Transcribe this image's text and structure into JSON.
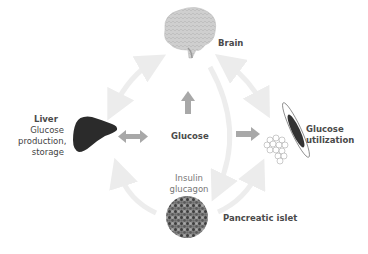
{
  "diagram": {
    "nodes": {
      "brain": {
        "label": "Brain"
      },
      "liver": {
        "label": "Liver",
        "sublabel": [
          "Glucose",
          "production,",
          "storage"
        ]
      },
      "glucose": {
        "label": "Glucose"
      },
      "muscle_fat": {
        "label": [
          "Glucose",
          "utilization"
        ]
      },
      "hormones": {
        "label": [
          "Insulin",
          "glucagon"
        ]
      },
      "pancreas": {
        "label": "Pancreatic islet"
      }
    },
    "colors": {
      "label_bold": "#4a4a4a",
      "label_light": "#777777",
      "arrow_dark": "#a8a8a8",
      "arrow_light": "#eeeeee",
      "liver": "#2b2b2b",
      "brain": "#c8c8c8"
    },
    "connections": [
      {
        "from": "glucose",
        "to": "brain",
        "style": "solid-dark"
      },
      {
        "from": "glucose",
        "to": "liver",
        "style": "double-dark"
      },
      {
        "from": "glucose",
        "to": "muscle_fat",
        "style": "solid-dark"
      },
      {
        "from": "liver",
        "to": "brain",
        "style": "double-light"
      },
      {
        "from": "brain",
        "to": "muscle_fat",
        "style": "double-light"
      },
      {
        "from": "brain",
        "to": "pancreas",
        "style": "light"
      },
      {
        "from": "pancreas",
        "to": "liver",
        "style": "light"
      },
      {
        "from": "pancreas",
        "to": "muscle_fat",
        "style": "light"
      }
    ]
  }
}
